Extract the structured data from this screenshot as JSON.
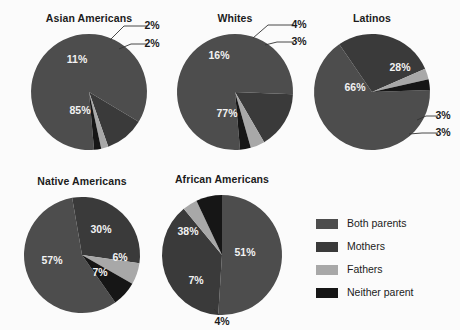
{
  "figure": {
    "background_color": "#fbfbfb",
    "width": 460,
    "height": 330
  },
  "legend": {
    "position": "bottom-right",
    "items": [
      {
        "label": "Both parents",
        "color": "#4d4d4d"
      },
      {
        "label": "Mothers",
        "color": "#3a3a3a"
      },
      {
        "label": "Fathers",
        "color": "#a8a8a8"
      },
      {
        "label": "Neither parent",
        "color": "#161616"
      }
    ]
  },
  "chart_data": {
    "type": "pie",
    "title": "",
    "categories": [
      "Both parents",
      "Mothers",
      "Fathers",
      "Neither parent"
    ],
    "colors": [
      "#4d4d4d",
      "#3a3a3a",
      "#a8a8a8",
      "#161616"
    ],
    "charts": [
      {
        "title": "Asian Americans",
        "cx": 89,
        "cy": 92,
        "r": 58,
        "start_angle": 175,
        "values": [
          85,
          11,
          2,
          2
        ],
        "labels": [
          "85%",
          "11%",
          "2%",
          "2%"
        ],
        "label_placement": [
          "inside",
          "inside",
          "leader",
          "leader"
        ],
        "label_points": [
          {
            "x": 80,
            "y": 111
          },
          {
            "x": 77,
            "y": 60
          },
          {
            "x": 152,
            "y": 26
          },
          {
            "x": 152,
            "y": 44
          }
        ],
        "leaders": [
          null,
          null,
          {
            "path": "M 110 40 L 124 26 L 147 26"
          },
          {
            "path": "M 119 49 L 131 44 L 147 44"
          }
        ]
      },
      {
        "title": "Whites",
        "cx": 235,
        "cy": 92,
        "r": 58,
        "start_angle": 175,
        "values": [
          77,
          16,
          4,
          3
        ],
        "labels": [
          "77%",
          "16%",
          "4%",
          "3%"
        ],
        "label_placement": [
          "inside",
          "inside",
          "leader",
          "leader"
        ],
        "label_points": [
          {
            "x": 227,
            "y": 114
          },
          {
            "x": 219,
            "y": 56
          },
          {
            "x": 299,
            "y": 25
          },
          {
            "x": 299,
            "y": 42
          }
        ],
        "leaders": [
          null,
          null,
          {
            "path": "M 253 38 L 268 25 L 294 25"
          },
          {
            "path": "M 265 45 L 277 42 L 294 42"
          }
        ]
      },
      {
        "title": "Latinos",
        "cx": 372,
        "cy": 92,
        "r": 58,
        "start_angle": 88,
        "values": [
          66,
          28,
          3,
          3
        ],
        "labels": [
          "66%",
          "28%",
          "3%",
          "3%"
        ],
        "label_placement": [
          "inside",
          "inside",
          "leader",
          "leader"
        ],
        "label_points": [
          {
            "x": 355,
            "y": 88
          },
          {
            "x": 400,
            "y": 68
          },
          {
            "x": 443,
            "y": 116
          },
          {
            "x": 443,
            "y": 133
          }
        ],
        "leaders": [
          null,
          null,
          {
            "path": "M 417 120 L 426 116 L 438 116"
          },
          {
            "path": "M 409 134 L 422 133 L 438 133"
          }
        ]
      },
      {
        "title": "Native Americans",
        "cx": 82,
        "cy": 255,
        "r": 58,
        "start_angle": 145,
        "values": [
          57,
          30,
          6,
          7
        ],
        "labels": [
          "57%",
          "30%",
          "6%",
          "7%"
        ],
        "label_placement": [
          "inside",
          "inside",
          "inside",
          "inside"
        ],
        "label_points": [
          {
            "x": 52,
            "y": 261
          },
          {
            "x": 101,
            "y": 230
          },
          {
            "x": 120,
            "y": 258
          },
          {
            "x": 100,
            "y": 273
          }
        ],
        "leaders": [
          null,
          null,
          null,
          null
        ]
      },
      {
        "title": "African Americans",
        "cx": 222,
        "cy": 255,
        "r": 60,
        "start_angle": 0,
        "values": [
          51,
          38,
          4,
          7
        ],
        "labels": [
          "51%",
          "38%",
          "4%",
          "7%"
        ],
        "label_placement": [
          "inside",
          "inside",
          "leader",
          "inside"
        ],
        "label_points": [
          {
            "x": 245,
            "y": 253
          },
          {
            "x": 188,
            "y": 232
          },
          {
            "x": 222,
            "y": 322
          },
          {
            "x": 196,
            "y": 281
          }
        ],
        "leaders": [
          null,
          null,
          {
            "path": "M 214 309 L 219 315"
          },
          null
        ]
      }
    ]
  },
  "titles": {
    "asian_americans": "Asian Americans",
    "whites": "Whites",
    "latinos": "Latinos",
    "native_americans": "Native Americans",
    "african_americans": "African Americans"
  }
}
